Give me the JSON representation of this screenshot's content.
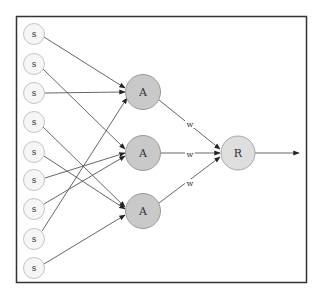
{
  "diagram": {
    "title": "",
    "sensor_nodes": [
      {
        "id": "S1",
        "label": "s",
        "y": 34,
        "target": "A1"
      },
      {
        "id": "S2",
        "label": "s",
        "y": 64,
        "target": "A2"
      },
      {
        "id": "S3",
        "label": "s",
        "y": 93,
        "target": "A1"
      },
      {
        "id": "S4",
        "label": "s",
        "y": 122,
        "target": "A3"
      },
      {
        "id": "S5",
        "label": "s",
        "y": 152,
        "target": "A3"
      },
      {
        "id": "S6",
        "label": "s",
        "y": 180,
        "target": "A2"
      },
      {
        "id": "S7",
        "label": "s",
        "y": 209,
        "target": "A2"
      },
      {
        "id": "S8",
        "label": "s",
        "y": 239,
        "target": "A1"
      },
      {
        "id": "S9",
        "label": "s",
        "y": 268,
        "target": "A3"
      }
    ],
    "association_nodes": [
      {
        "id": "A1",
        "label": "A",
        "y": 92
      },
      {
        "id": "A2",
        "label": "A",
        "y": 153
      },
      {
        "id": "A3",
        "label": "A",
        "y": 211
      }
    ],
    "weight_labels": [
      "w",
      "w",
      "w"
    ],
    "response_node": {
      "id": "R",
      "label": "R"
    },
    "output": "arrow",
    "colors": {
      "sensor_fill": "#f6f6f6",
      "association_fill": "#c9c9c9",
      "response_fill": "#dedede",
      "edge": "#555555",
      "frame": "#333333"
    }
  }
}
